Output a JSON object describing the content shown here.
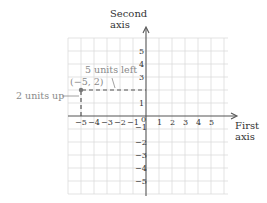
{
  "diagram": {
    "type": "coordinate-plane",
    "axes": {
      "x_label_line1": "First",
      "x_label_line2": "axis",
      "y_label_line1": "Second",
      "y_label_line2": "axis",
      "x_ticks": [
        "−5",
        "−4",
        "−3",
        "−2",
        "−1",
        "1",
        "2",
        "3",
        "4",
        "5"
      ],
      "y_ticks": [
        "5",
        "4",
        "3",
        "1",
        "−1",
        "−2",
        "−3",
        "−4",
        "−5"
      ],
      "origin_label": "0"
    },
    "point": {
      "label": "(−5, 2)",
      "x": -5,
      "y": 2
    },
    "annotations": {
      "horizontal": "5 units left",
      "vertical": "2 units up"
    },
    "colors": {
      "grid": "#dcdcdc",
      "axis": "#555555",
      "annotation": "#8a8a8a",
      "text": "#333333"
    }
  }
}
